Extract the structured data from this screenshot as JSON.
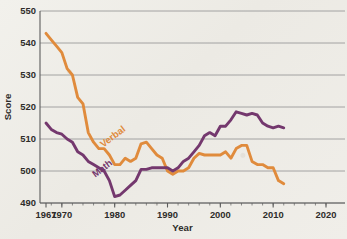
{
  "chart_data": {
    "type": "line",
    "title": "",
    "xlabel": "Year",
    "ylabel": "Score",
    "xlim": [
      1965,
      2021
    ],
    "ylim": [
      490,
      550
    ],
    "yticks": [
      490,
      500,
      510,
      520,
      530,
      540,
      550
    ],
    "xticks": [
      1967,
      1970,
      1980,
      1990,
      2000,
      2010,
      2020
    ],
    "xtick_labels": [
      "1967",
      "1970",
      "1980",
      "1990",
      "2000",
      "2010",
      "2020"
    ],
    "ytick_labels": [
      "490",
      "500",
      "510",
      "520",
      "530",
      "540",
      "550"
    ],
    "grid": "horizontal",
    "legend": "inline-labels",
    "colors": {
      "verbal": "#e08b3c",
      "math": "#74386e",
      "grid": "#9a9a9a",
      "axis": "#5c5c5c",
      "text": "#2e2c2a"
    },
    "series": [
      {
        "name": "Verbal",
        "color": "#e08b3c",
        "label_position": "inline",
        "x": [
          1967,
          1968,
          1969,
          1970,
          1971,
          1972,
          1973,
          1974,
          1975,
          1976,
          1977,
          1978,
          1979,
          1980,
          1981,
          1982,
          1983,
          1984,
          1985,
          1986,
          1987,
          1988,
          1989,
          1990,
          1991,
          1992,
          1993,
          1994,
          1995,
          1996,
          1997,
          1998,
          1999,
          2000,
          2001,
          2002,
          2003,
          2004,
          2005,
          2006,
          2007,
          2008,
          2009,
          2010,
          2011,
          2012
        ],
        "values": [
          543,
          541,
          539,
          537,
          532,
          530,
          523,
          521,
          512,
          509,
          507,
          507,
          505,
          502,
          502,
          504,
          503,
          504,
          508.5,
          509,
          507,
          505,
          504,
          500,
          499,
          500,
          500,
          501,
          504,
          505.5,
          505,
          505,
          505,
          505,
          506,
          504,
          507,
          508,
          508,
          503,
          502,
          502,
          501,
          501,
          497,
          496
        ]
      },
      {
        "name": "Math",
        "color": "#74386e",
        "label_position": "inline",
        "x": [
          1967,
          1968,
          1969,
          1970,
          1971,
          1972,
          1973,
          1974,
          1975,
          1976,
          1977,
          1978,
          1979,
          1980,
          1981,
          1982,
          1983,
          1984,
          1985,
          1986,
          1987,
          1988,
          1989,
          1990,
          1991,
          1992,
          1993,
          1994,
          1995,
          1996,
          1997,
          1998,
          1999,
          2000,
          2001,
          2002,
          2003,
          2004,
          2005,
          2006,
          2007,
          2008,
          2009,
          2010,
          2011,
          2012
        ],
        "values": [
          515,
          513,
          512,
          511.5,
          510,
          509,
          506,
          505,
          503,
          502,
          501,
          500,
          497,
          492,
          492.5,
          494,
          495.5,
          497,
          500.5,
          500.5,
          501,
          501,
          501,
          501,
          500,
          501,
          503,
          504,
          506,
          508,
          511,
          512,
          511,
          514,
          514,
          516,
          518.5,
          518,
          517.5,
          518,
          517.5,
          515,
          514,
          513.5,
          514,
          513.5
        ]
      }
    ],
    "annotations": [
      {
        "text": "Verbal",
        "series": "Verbal",
        "x": 1980,
        "y": 510,
        "rotation": 37
      },
      {
        "text": "Math",
        "series": "Math",
        "x": 1978,
        "y": 500,
        "rotation": 37
      }
    ]
  }
}
